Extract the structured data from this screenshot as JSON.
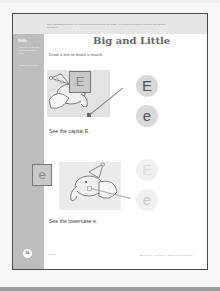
{
  "page": {
    "header_note": "Note: Throughout the book, tell your student all about how to play it safe. You can help your student learn the letter sounds and names.",
    "title": "Big and Little",
    "instruction": "Draw a line to make a match.",
    "sidebar": {
      "title": "Skills",
      "skills_text": "Matching capital and lowercase forms of letters",
      "extra_text": "Visual discrimination"
    },
    "section1": {
      "card_letter": "E",
      "caption": "See the capital E.",
      "choices": [
        "E",
        "e"
      ]
    },
    "section2": {
      "card_letter": "e",
      "caption": "See the lowercase e.",
      "choices": [
        "E",
        "e"
      ]
    },
    "footer": {
      "page_number": "56",
      "unit": "Unit 3",
      "copyright": "Spell & Write • ABC 1010 • ©2010 by Free Minds Corp."
    }
  },
  "colors": {
    "sidebar": "#bdbdbd",
    "header_band": "#e6e6e6",
    "page_border": "#4a4a4a"
  }
}
